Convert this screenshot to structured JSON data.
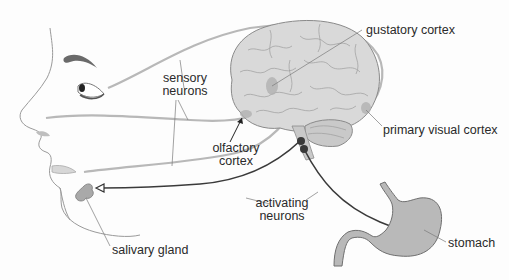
{
  "diagram": {
    "type": "anatomical-illustration",
    "labels": {
      "gustatory_cortex": "gustatory cortex",
      "sensory_neurons_line1": "sensory",
      "sensory_neurons_line2": "neurons",
      "olfactory_cortex_line1": "olfactory",
      "olfactory_cortex_line2": "cortex",
      "primary_visual_cortex": "primary visual cortex",
      "activating_neurons_line1": "activating",
      "activating_neurons_line2": "neurons",
      "salivary_gland": "salivary gland",
      "stomach": "stomach"
    },
    "colors": {
      "background": "#fdfdfd",
      "sensory_neuron": "#b8b8b8",
      "activating_neuron": "#3a3a3a",
      "brain_fill": "#d9d9d9",
      "brain_outline": "#8a8a8a",
      "organ_fill": "#b9b9b9",
      "face_outline": "#9a9a9a",
      "label_text": "#2a2a2a",
      "leader_line": "#7a7a7a"
    }
  }
}
